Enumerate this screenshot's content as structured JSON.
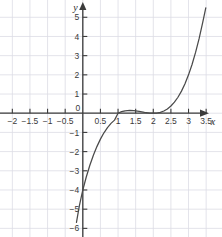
{
  "chart_data": {
    "type": "line",
    "title": "",
    "xlabel": "x",
    "ylabel": "y",
    "function": "y = (x - 1)(x - 2)^2",
    "xlim": [
      -2.35,
      3.95
    ],
    "ylim": [
      -6.45,
      5.9
    ],
    "grid": true,
    "grid_x_step": 0.5,
    "grid_y_step": 1,
    "legend": "none",
    "x_tick_labels": [
      "-2",
      "-1.5",
      "-1",
      "-0.5",
      "0.5",
      "1",
      "1.5",
      "2",
      "2.5",
      "3",
      "3.5"
    ],
    "x_tick_values": [
      -2,
      -1.5,
      -1,
      -0.5,
      0.5,
      1,
      1.5,
      2,
      2.5,
      3,
      3.5
    ],
    "y_tick_labels": [
      "-6",
      "-5",
      "-4",
      "-3",
      "-2",
      "-1",
      "1",
      "2",
      "3",
      "4",
      "5"
    ],
    "y_tick_values": [
      -6,
      -5,
      -4,
      -3,
      -2,
      -1,
      1,
      2,
      3,
      4,
      5
    ],
    "origin_label": "0",
    "x": [
      -0.18,
      -0.1,
      0.0,
      0.1,
      0.2,
      0.3,
      0.4,
      0.5,
      0.6,
      0.7,
      0.8,
      0.9,
      1.0,
      1.1,
      1.2,
      1.3333,
      1.45,
      1.6,
      1.75,
      1.9,
      2.0,
      2.1,
      2.2,
      2.3,
      2.4,
      2.5,
      2.6,
      2.7,
      2.8,
      2.9,
      3.0,
      3.1,
      3.2,
      3.3,
      3.4,
      3.49
    ],
    "y": [
      -5.69,
      -4.84,
      -4.0,
      -3.31,
      -2.71,
      -2.19,
      -1.74,
      -1.35,
      -1.02,
      -0.75,
      -0.53,
      -0.36,
      0.0,
      0.081,
      0.128,
      0.148,
      0.135,
      0.096,
      0.047,
      0.009,
      0.0,
      0.011,
      0.048,
      0.117,
      0.224,
      0.375,
      0.576,
      0.833,
      1.152,
      1.539,
      2.0,
      2.541,
      3.168,
      3.887,
      4.704,
      5.495
    ],
    "key_points": {
      "y_intercept": -4,
      "root_simple": 1,
      "root_double": 2,
      "local_max_x": 1.3333,
      "local_max_y": 0.148
    },
    "curve_color": "#4a4a4a",
    "axis_color": "#3b3b3b",
    "grid_color": "#dcdce4"
  }
}
